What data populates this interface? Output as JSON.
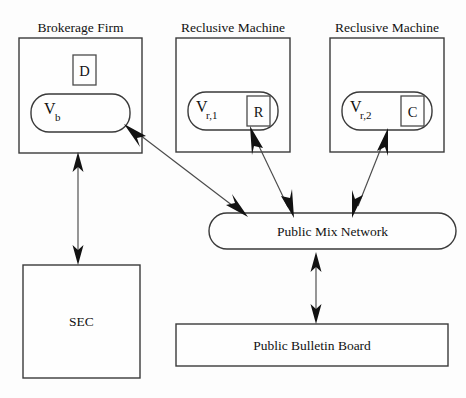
{
  "diagram": {
    "background_color": "#fdfdfd",
    "line_color": "#3a3a3a",
    "text_color": "#121212",
    "captions": [
      {
        "id": "brokerage-caption",
        "text": "Brokerage Firm"
      },
      {
        "id": "reclusive1-caption",
        "text": "Reclusive Machine"
      },
      {
        "id": "reclusive2-caption",
        "text": "Reclusive Machine"
      }
    ],
    "nodes": {
      "brokerage_firm": {
        "caption": "Brokerage Firm",
        "inner_box_label": "D",
        "vault_main": "V",
        "vault_sub": "b"
      },
      "reclusive_machine_1": {
        "caption": "Reclusive Machine",
        "inner_box_label": "R",
        "vault_main": "V",
        "vault_sub": "r,1"
      },
      "reclusive_machine_2": {
        "caption": "Reclusive Machine",
        "inner_box_label": "C",
        "vault_main": "V",
        "vault_sub": "r,2"
      },
      "public_mix_network": {
        "label": "Public Mix Network",
        "shape": "rounded-rectangle"
      },
      "public_bulletin_board": {
        "label": "Public Bulletin Board",
        "shape": "rectangle"
      },
      "sec": {
        "label": "SEC",
        "shape": "rectangle"
      }
    },
    "edges": [
      {
        "id": "edge-brokerage-sec",
        "from": "Brokerage Firm",
        "to": "SEC",
        "style": "double-headed",
        "orientation": "vertical"
      },
      {
        "id": "edge-brokerage-mix",
        "from": "Brokerage Firm",
        "to": "Public Mix Network",
        "style": "double-headed",
        "orientation": "diagonal"
      },
      {
        "id": "edge-reclusive1-mix",
        "from": "Reclusive Machine 1",
        "to": "Public Mix Network",
        "style": "double-headed",
        "orientation": "diagonal"
      },
      {
        "id": "edge-reclusive2-mix",
        "from": "Reclusive Machine 2",
        "to": "Public Mix Network",
        "style": "double-headed",
        "orientation": "diagonal"
      },
      {
        "id": "edge-mix-bulletin",
        "from": "Public Mix Network",
        "to": "Public Bulletin Board",
        "style": "double-headed",
        "orientation": "vertical"
      }
    ]
  }
}
